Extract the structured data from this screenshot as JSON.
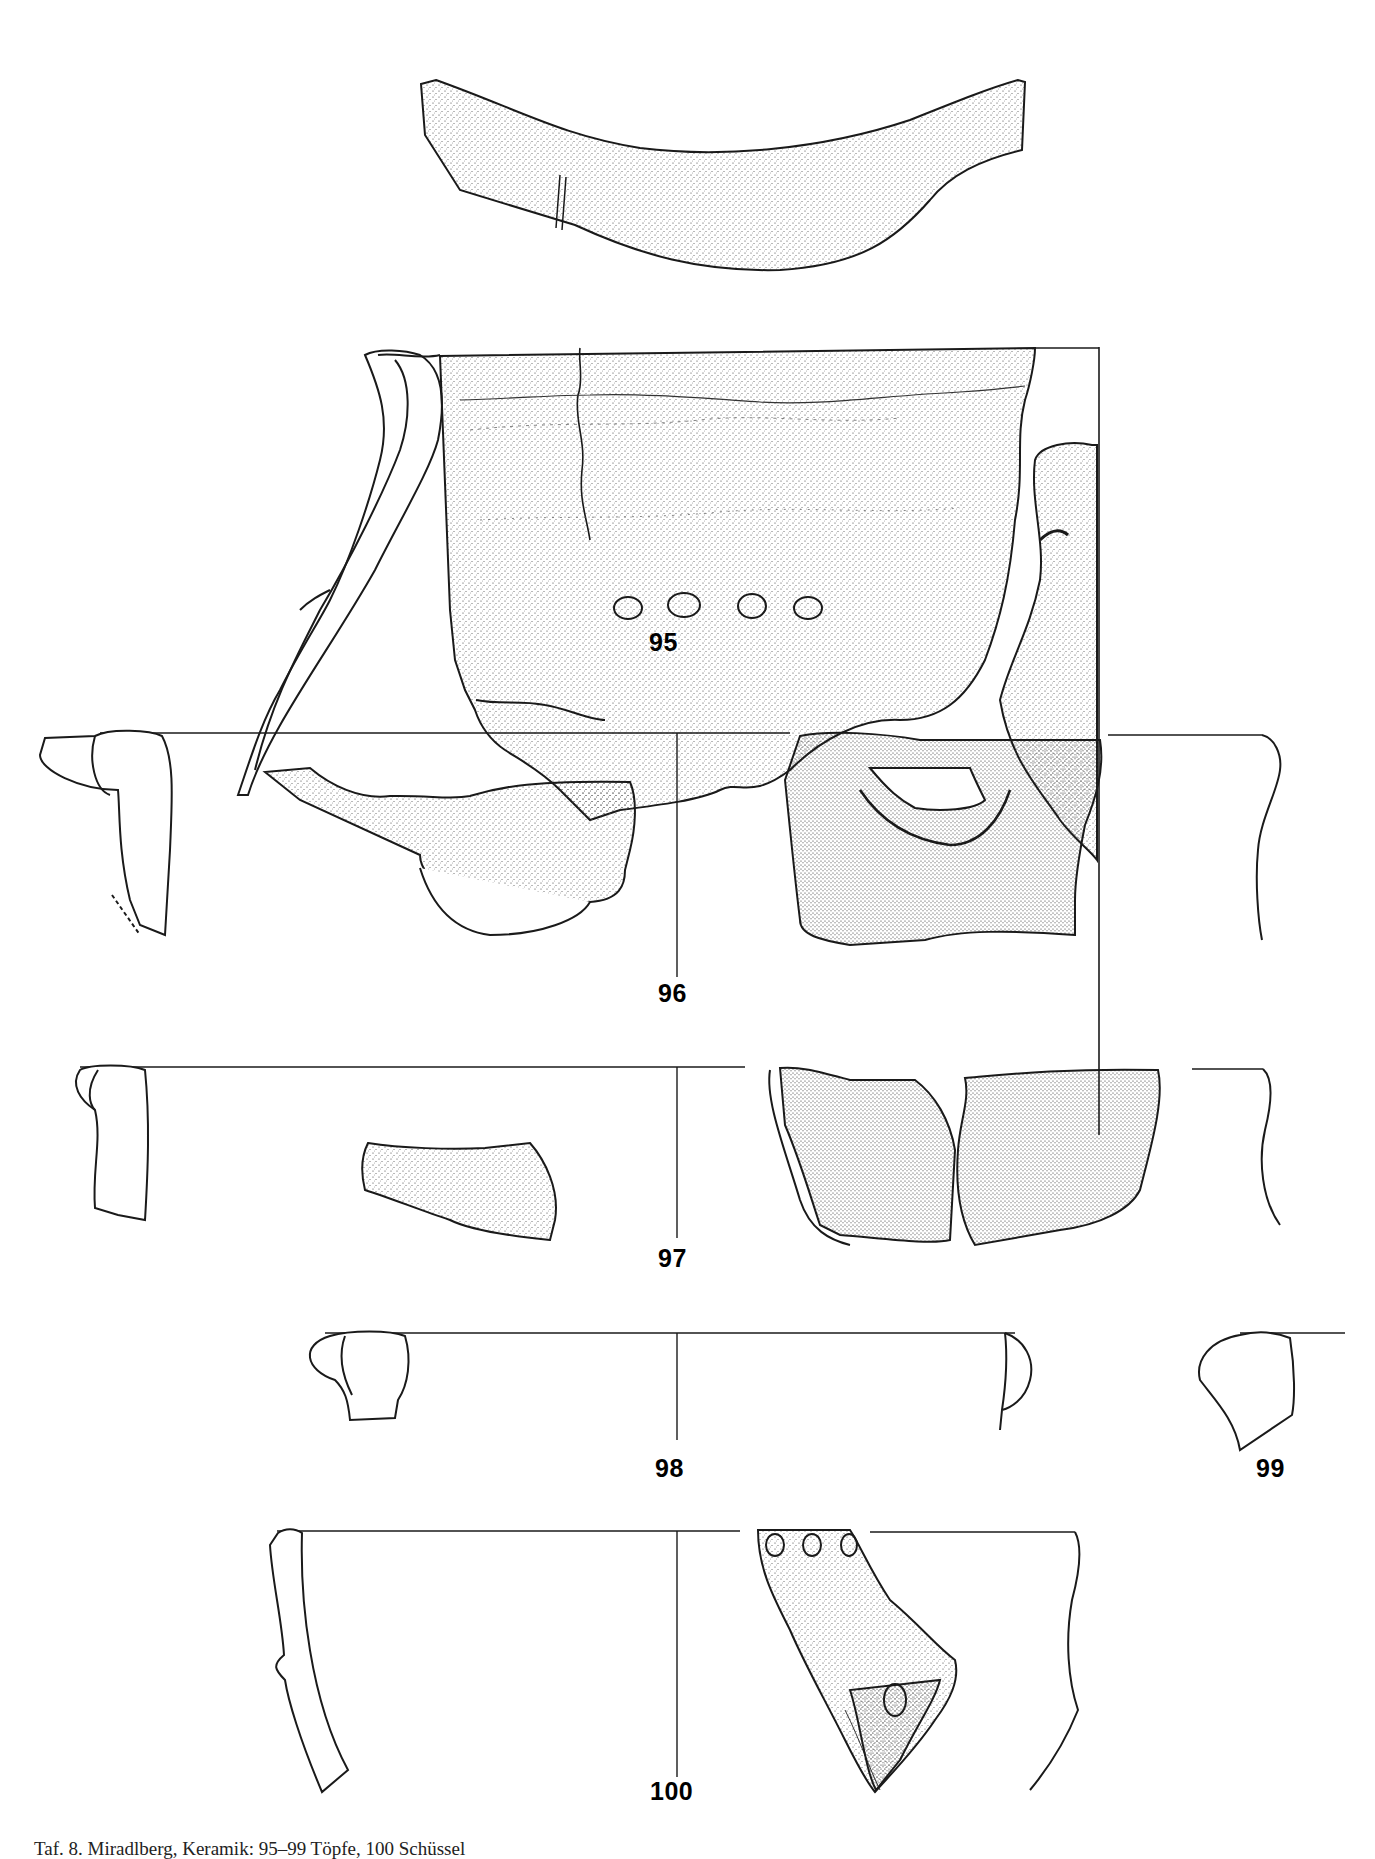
{
  "plate": {
    "caption": "Taf. 8. Miradlberg, Kerami\u0006k: 95–99 Töpfe, 100 Schüssel",
    "caption_visible": "Taf. 8.  Miradlberg, Keramik: 95–99 Töpfe, 100 Schüssel"
  },
  "figures": [
    {
      "id": "fig-95",
      "label": "95",
      "type": "pot sherd with handle and rim profile"
    },
    {
      "id": "fig-96",
      "label": "96",
      "type": "rim sherds with lug, profiles"
    },
    {
      "id": "fig-97",
      "label": "97",
      "type": "rim sherds, profiles"
    },
    {
      "id": "fig-98",
      "label": "98",
      "type": "rim profile"
    },
    {
      "id": "fig-99",
      "label": "99",
      "type": "rim profile"
    },
    {
      "id": "fig-100",
      "label": "100",
      "type": "bowl sherd with fingertip impressions, profile"
    }
  ],
  "colors": {
    "ink": "#1a1a1a",
    "paper": "#ffffff"
  }
}
